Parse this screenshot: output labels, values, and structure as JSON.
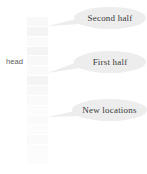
{
  "diagram": {
    "title_label": "head",
    "column": {
      "name": "hash-table-column",
      "cell_count": 15,
      "shades": [
        "alt",
        "",
        "faint",
        "",
        "alt",
        "faint",
        "",
        "alt",
        "faint",
        "faintest",
        "faint",
        "faintest",
        "faint",
        "faintest",
        "faintest"
      ]
    },
    "callouts": [
      {
        "id": "second-half",
        "label": "Second half",
        "target_y": 26,
        "anchor_x": 48,
        "tail_x": 78,
        "tail_y": 20
      },
      {
        "id": "first-half",
        "label": "First half",
        "target_y": 73,
        "anchor_x": 48,
        "tail_x": 78,
        "tail_y": 64
      },
      {
        "id": "new-locations",
        "label": "New locations",
        "target_y": 117,
        "anchor_x": 48,
        "tail_x": 77,
        "tail_y": 112
      }
    ],
    "colors": {
      "cell_fill": "#f4f4f4",
      "bubble_fill": "#ededed",
      "text": "#3a3a3a",
      "label_text": "#5a5a5a",
      "background": "#ffffff"
    }
  }
}
